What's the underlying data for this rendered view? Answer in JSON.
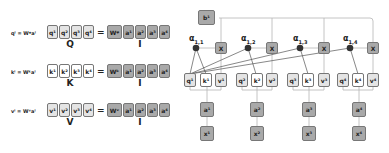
{
  "left": {
    "rows": [
      {
        "equation": "qⁱ = Wᵠaⁱ",
        "cells": [
          "q¹",
          "q²",
          "q³",
          "q⁴"
        ],
        "matrix_label": "Q",
        "weight": "Wᵠ",
        "inputs": [
          "a¹",
          "a²",
          "a³",
          "a⁴"
        ],
        "input_label": "I",
        "style": "light"
      },
      {
        "equation": "kⁱ = Wᵏaⁱ",
        "cells": [
          "k¹",
          "k²",
          "k³",
          "k⁴"
        ],
        "matrix_label": "K",
        "weight": "Wᵏ",
        "inputs": [
          "a¹",
          "a²",
          "a³",
          "a⁴"
        ],
        "input_label": "I",
        "style": "white"
      },
      {
        "equation": "vⁱ = Wᵛaⁱ",
        "cells": [
          "v¹",
          "v²",
          "v³",
          "v⁴"
        ],
        "matrix_label": "V",
        "weight": "Wᵛ",
        "inputs": [
          "a¹",
          "a²",
          "a³",
          "a⁴"
        ],
        "input_label": "I",
        "style": "light"
      }
    ],
    "equals": "="
  },
  "right": {
    "output": "b¹",
    "alphas": [
      {
        "base": "α",
        "sub": "1,1"
      },
      {
        "base": "α",
        "sub": "1,2"
      },
      {
        "base": "α",
        "sub": "1,3"
      },
      {
        "base": "α",
        "sub": "1,4"
      }
    ],
    "multiply": "X",
    "columns": [
      {
        "q": "q¹",
        "k": "k¹",
        "v": "v¹",
        "a": "a¹",
        "x": "x¹"
      },
      {
        "q": "q²",
        "k": "k²",
        "v": "v²",
        "a": "a²",
        "x": "x²"
      },
      {
        "q": "q³",
        "k": "k³",
        "v": "v³",
        "a": "a³",
        "x": "x³"
      },
      {
        "q": "q⁴",
        "k": "k⁴",
        "v": "v⁴",
        "a": "a⁴",
        "x": "x⁴"
      }
    ]
  }
}
